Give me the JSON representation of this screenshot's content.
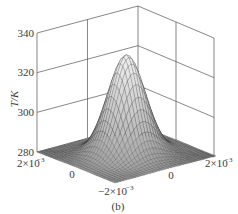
{
  "chart_data": {
    "type": "surface3d",
    "title": "",
    "caption": "(b)",
    "zlabel": "T/K",
    "xlabel": "",
    "ylabel": "",
    "zlim": [
      280,
      340
    ],
    "z_ticks": [
      "280",
      "300",
      "320",
      "340"
    ],
    "x_ticks": [
      "2×10⁻³",
      "0",
      "−2×10⁻³"
    ],
    "y_ticks": [
      "−2×10⁻³",
      "0",
      "2×10⁻³"
    ],
    "xlim": [
      -0.002,
      0.002
    ],
    "ylim": [
      -0.002,
      0.002
    ],
    "grid": true,
    "surface": {
      "shape": "gaussian",
      "center": [
        0,
        0
      ],
      "base_value": 280,
      "peak_value": 330,
      "sigma": 0.0006
    },
    "colormap": "grayscale"
  },
  "labels": {
    "z_axis": "T/K",
    "z_tick_340": "340",
    "z_tick_320": "320",
    "z_tick_300": "300",
    "z_tick_280": "280",
    "left_tick_2e3": "2×10",
    "left_tick_zero": "0",
    "front_tick_m2e3": "−2×10",
    "right_tick_zero": "0",
    "right_tick_2e3": "2×10",
    "exp": "−3",
    "caption": "(b)"
  }
}
